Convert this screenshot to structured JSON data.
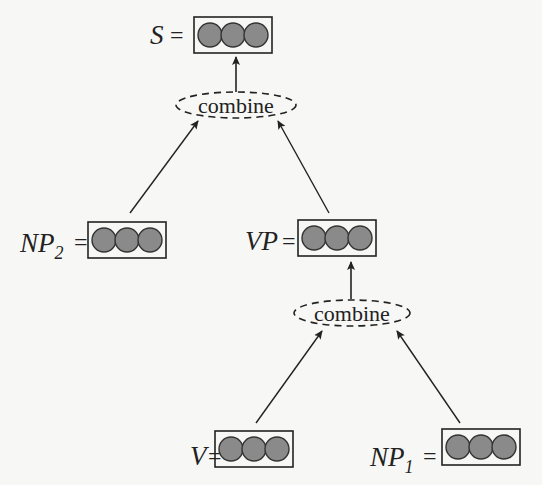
{
  "diagram": {
    "type": "composition-tree",
    "colors": {
      "node_fill": "#8a8a8a",
      "stroke": "#222222",
      "background": "#f7f7f5"
    },
    "nodes": {
      "S": {
        "label": "S",
        "sub": "",
        "eq": "="
      },
      "NP2": {
        "label": "NP",
        "sub": "2",
        "eq": "="
      },
      "VP": {
        "label": "VP",
        "sub": "",
        "eq": "="
      },
      "V": {
        "label": "V",
        "sub": "",
        "eq": "="
      },
      "NP1": {
        "label": "NP",
        "sub": "1",
        "eq": "="
      }
    },
    "operations": {
      "top": {
        "label": "combine"
      },
      "bottom": {
        "label": "combine"
      }
    },
    "edges": [
      {
        "from": "NP2",
        "to": "combine-top"
      },
      {
        "from": "VP",
        "to": "combine-top"
      },
      {
        "from": "combine-top",
        "to": "S"
      },
      {
        "from": "V",
        "to": "combine-bottom"
      },
      {
        "from": "NP1",
        "to": "combine-bottom"
      },
      {
        "from": "combine-bottom",
        "to": "VP"
      }
    ]
  }
}
